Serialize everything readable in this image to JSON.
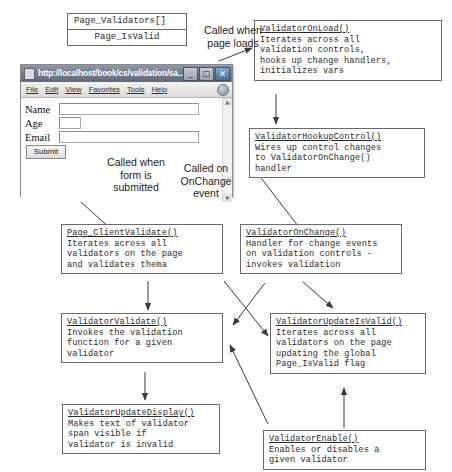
{
  "diagram": {
    "globals": {
      "line1": "Page_Validators[]",
      "line2": "Page_IsValid"
    },
    "annotations": [
      {
        "name": "called-when-page-loads",
        "text": "Called when\npage loads"
      },
      {
        "name": "called-when-form-is-submitted",
        "text": "Called when\nform is\nsubmitted"
      },
      {
        "name": "called-on-onchange-event",
        "text": "Called on\nOnChange\nevent"
      }
    ],
    "boxes": [
      {
        "id": "validator-on-load",
        "name": "ValidatorOnLoad()",
        "lines": [
          "Iterates across all",
          "validation controls,",
          "hooks up change handlers,",
          "initializes vars"
        ]
      },
      {
        "id": "validator-hookup-control",
        "name": "ValidatorHookupControl()",
        "lines": [
          "Wires up control changes",
          "to ValidatorOnChange()",
          "handler"
        ]
      },
      {
        "id": "page-client-validate",
        "name": "Page_ClientValidate()",
        "lines": [
          "Iterates across all",
          "validators on the page",
          "and validates thema"
        ]
      },
      {
        "id": "validator-on-change",
        "name": "ValidatorOnChange()",
        "lines": [
          "Handler for change events",
          "on validation controls -",
          "invokes validation"
        ]
      },
      {
        "id": "validator-validate",
        "name": "ValidatorValidate()",
        "lines": [
          "Invokes the validation",
          "function for a given",
          "validator"
        ]
      },
      {
        "id": "validator-update-is-valid",
        "name": "ValidatorUpdateIsValid()",
        "lines": [
          "Iterates across all",
          "validators on the page",
          "updating the global",
          "Page_IsValid flag"
        ]
      },
      {
        "id": "validator-update-display",
        "name": "ValidatorUpdateDisplay()",
        "lines": [
          "Makes text of validator",
          "span visible if",
          "validator is invalid"
        ]
      },
      {
        "id": "validator-enable",
        "name": "ValidatorEnable()",
        "lines": [
          "Enables or disables a",
          "given validator"
        ]
      }
    ],
    "colors": {
      "box_border": "#6b6b6b",
      "arrow": "#3a3a3a",
      "text": "#2a2a2a",
      "titlebar": "#74808f"
    }
  },
  "browser": {
    "title": "http://localhost/book/cs/validation/sa...",
    "favicon": "page-icon",
    "window_buttons": [
      {
        "name": "minimize-button",
        "glyph": "_"
      },
      {
        "name": "maximize-button",
        "glyph": "□"
      },
      {
        "name": "close-button",
        "glyph": "✕"
      }
    ],
    "menu": [
      "File",
      "Edit",
      "View",
      "Favorites",
      "Tools",
      "Help"
    ],
    "form": {
      "fields": [
        {
          "label": "Name",
          "value": "",
          "size": "wide"
        },
        {
          "label": "Age",
          "value": "",
          "size": "narrow"
        },
        {
          "label": "Email",
          "value": "",
          "size": "wide"
        }
      ],
      "submit_label": "Submit"
    },
    "scrollbar": {
      "up": "▲",
      "down": "▼"
    }
  }
}
